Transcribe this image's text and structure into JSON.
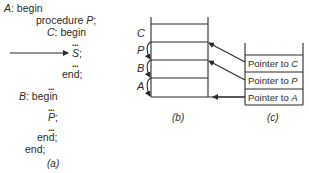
{
  "part_a": {
    "lines": [
      {
        "label": "A",
        "text": "begin"
      },
      {
        "text": "procedure",
        "name": "P",
        "suffix": ";"
      },
      {
        "label": "C",
        "text": "begin"
      },
      {
        "dots": "..."
      },
      {
        "stmt": "S",
        "suffix": ";"
      },
      {
        "dots": "..."
      },
      {
        "text": "end;"
      },
      {
        "dots": "..."
      },
      {
        "label": "B",
        "text": "begin"
      },
      {
        "dots": "..."
      },
      {
        "stmt": "P",
        "suffix": ";"
      },
      {
        "dots": "..."
      },
      {
        "text": "end;"
      },
      {
        "text": "end;"
      }
    ],
    "caption": "(a)"
  },
  "part_b": {
    "labels": [
      "C",
      "P",
      "B",
      "A"
    ],
    "caption": "(b)"
  },
  "part_c": {
    "cells": [
      {
        "prefix": "Pointer to",
        "target": "C"
      },
      {
        "prefix": "Pointer to",
        "target": "P"
      },
      {
        "prefix": "Pointer to",
        "target": "A"
      }
    ],
    "caption": "(c)"
  },
  "colors": {
    "ink": "#2a2a2a",
    "background": "#ffffff"
  }
}
